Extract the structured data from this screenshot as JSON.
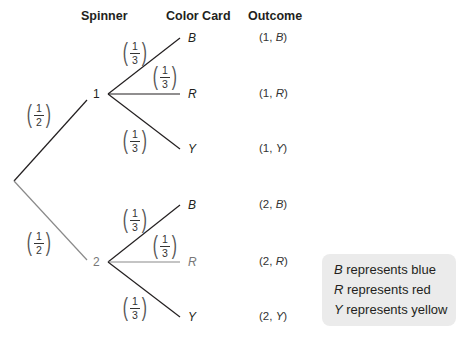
{
  "headers": {
    "spinner": "Spinner",
    "color_card": "Color Card",
    "outcome": "Outcome"
  },
  "spinner_nodes": [
    {
      "label": "1",
      "probability": {
        "num": "1",
        "den": "2"
      }
    },
    {
      "label": "2",
      "probability": {
        "num": "1",
        "den": "2"
      }
    }
  ],
  "branches": {
    "spinner1": [
      {
        "leaf": "B",
        "num": "1",
        "den": "3",
        "outcome_spinner": "1",
        "outcome_card": "B"
      },
      {
        "leaf": "R",
        "num": "1",
        "den": "3",
        "outcome_spinner": "1",
        "outcome_card": "R"
      },
      {
        "leaf": "Y",
        "num": "1",
        "den": "3",
        "outcome_spinner": "1",
        "outcome_card": "Y"
      }
    ],
    "spinner2": [
      {
        "leaf": "B",
        "num": "1",
        "den": "3",
        "outcome_spinner": "2",
        "outcome_card": "B"
      },
      {
        "leaf": "R",
        "num": "1",
        "den": "3",
        "outcome_spinner": "2",
        "outcome_card": "R"
      },
      {
        "leaf": "Y",
        "num": "1",
        "den": "3",
        "outcome_spinner": "2",
        "outcome_card": "Y"
      }
    ]
  },
  "outcome_text": {
    "open": "(",
    "sep": ", ",
    "close": ")"
  },
  "legend": [
    {
      "letter": "B",
      "text": " represents blue"
    },
    {
      "letter": "R",
      "text": " represents red"
    },
    {
      "letter": "Y",
      "text": " represents yellow"
    }
  ],
  "colors": {
    "line_dark": "#231f20",
    "line_gray": "#8a8a8a",
    "legend_bg": "#ebebeb"
  }
}
